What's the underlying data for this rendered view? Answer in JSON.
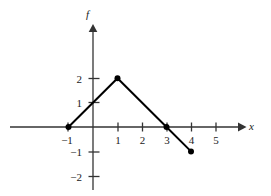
{
  "figure": {
    "name": "piecewise-linear-function-graph",
    "background_color": "#ffffff",
    "axis_color": "#333333",
    "curve_color": "#000000",
    "label_color": "#1a1a1a"
  },
  "chart_data": {
    "type": "line",
    "title": "",
    "subtitle": "",
    "xlabel": "x",
    "ylabel": "f",
    "x": [
      -1,
      1,
      3,
      4
    ],
    "values": [
      0,
      2,
      0,
      -1
    ],
    "series": [
      {
        "name": "f",
        "x": [
          -1,
          1,
          3,
          4
        ],
        "values": [
          0,
          2,
          0,
          -1
        ]
      }
    ],
    "points": [
      {
        "x": -1,
        "y": 0,
        "marker": "filled-circle"
      },
      {
        "x": 1,
        "y": 2,
        "marker": "filled-circle"
      },
      {
        "x": 3,
        "y": 0,
        "marker": "filled-circle"
      },
      {
        "x": 4,
        "y": -1,
        "marker": "filled-circle"
      }
    ],
    "xlim": [
      -2,
      6
    ],
    "ylim": [
      -2.6,
      2.9
    ],
    "xticks": [
      -1,
      1,
      2,
      3,
      4,
      5
    ],
    "xtick_labels": [
      "−1",
      "1",
      "2",
      "3",
      "4",
      "5"
    ],
    "yticks": [
      2,
      1,
      -1,
      -2
    ],
    "ytick_labels": [
      "2",
      "1",
      "−1",
      "−2"
    ],
    "grid": false,
    "legend": false,
    "legend_position": "none",
    "x_axis_arrow": true,
    "y_axis_arrow": true,
    "annotations": []
  }
}
